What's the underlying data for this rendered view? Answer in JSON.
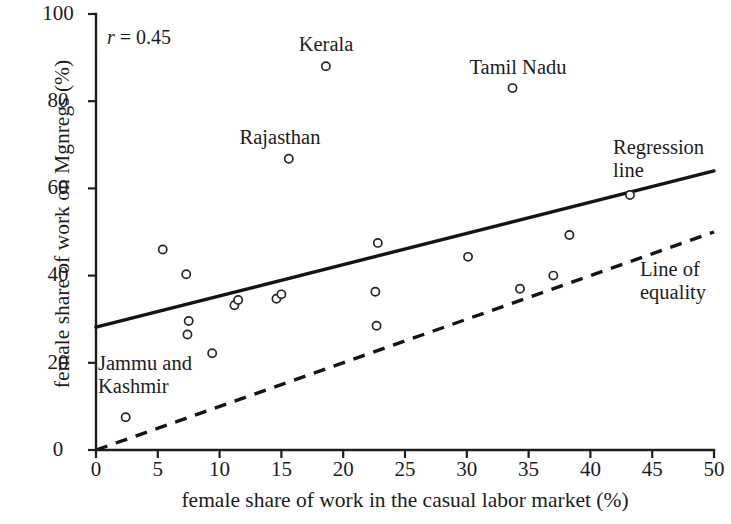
{
  "chart_data": {
    "type": "scatter",
    "title": "",
    "xlabel": "female share of work in the casual labor market (%)",
    "ylabel": "female share of work on Mgnregs (%)",
    "xlim": [
      0,
      50
    ],
    "ylim": [
      0,
      100
    ],
    "xticks": [
      "0",
      "5",
      "10",
      "15",
      "20",
      "25",
      "30",
      "35",
      "40",
      "45",
      "50"
    ],
    "yticks": [
      "0",
      "20",
      "40",
      "60",
      "80",
      "100"
    ],
    "grid": false,
    "annotation": "r = 0.45",
    "annotation_symbol": "r",
    "annotation_value": "= 0.45",
    "correlation": 0.45,
    "points": [
      {
        "x": 2.4,
        "y": 7.5,
        "label": "Jammu and Kashmir",
        "label_pos": "above"
      },
      {
        "x": 5.4,
        "y": 46.0,
        "label": ""
      },
      {
        "x": 7.3,
        "y": 40.3,
        "label": ""
      },
      {
        "x": 7.5,
        "y": 29.6,
        "label": ""
      },
      {
        "x": 7.4,
        "y": 26.5,
        "label": ""
      },
      {
        "x": 9.4,
        "y": 22.2,
        "label": ""
      },
      {
        "x": 11.2,
        "y": 33.2,
        "label": ""
      },
      {
        "x": 11.5,
        "y": 34.4,
        "label": ""
      },
      {
        "x": 14.6,
        "y": 34.7,
        "label": ""
      },
      {
        "x": 15.0,
        "y": 35.7,
        "label": ""
      },
      {
        "x": 15.6,
        "y": 66.8,
        "label": "Rajasthan",
        "label_pos": "above"
      },
      {
        "x": 18.6,
        "y": 88.0,
        "label": "Kerala",
        "label_pos": "above"
      },
      {
        "x": 22.8,
        "y": 47.5,
        "label": ""
      },
      {
        "x": 22.6,
        "y": 36.3,
        "label": ""
      },
      {
        "x": 22.7,
        "y": 28.5,
        "label": ""
      },
      {
        "x": 30.1,
        "y": 44.3,
        "label": ""
      },
      {
        "x": 33.7,
        "y": 83.0,
        "label": "Tamil Nadu",
        "label_pos": "above"
      },
      {
        "x": 34.3,
        "y": 37.0,
        "label": ""
      },
      {
        "x": 37.0,
        "y": 40.0,
        "label": ""
      },
      {
        "x": 38.3,
        "y": 49.3,
        "label": ""
      },
      {
        "x": 43.2,
        "y": 58.5,
        "label": ""
      }
    ],
    "series": [
      {
        "name": "Regression line",
        "type": "line",
        "style": "solid",
        "x": [
          0,
          50
        ],
        "y": [
          28.2,
          64.0
        ]
      },
      {
        "name": "Line of equality",
        "type": "line",
        "style": "dashed",
        "x": [
          0,
          50
        ],
        "y": [
          0,
          50
        ]
      }
    ],
    "legend_position": "inline-right",
    "legend": [
      {
        "label": "Regression line",
        "style": "solid"
      },
      {
        "label": "Line of equality",
        "style": "dashed"
      }
    ]
  },
  "labels": {
    "kerala": "Kerala",
    "tamil_nadu": "Tamil Nadu",
    "rajasthan": "Rajasthan",
    "jammu_kashmir_line1": "Jammu and",
    "jammu_kashmir_line2": "Kashmir",
    "regression_line1": "Regression",
    "regression_line2": "line",
    "equality_line1": "Line of",
    "equality_line2": "equality"
  },
  "axes": {
    "y_title": "female share of work on Mgnregs (%)",
    "x_title": "female share of work in the casual labor market (%)",
    "y_ticks": [
      "100",
      "80",
      "60",
      "40",
      "20",
      "0"
    ],
    "x_ticks": [
      "0",
      "5",
      "10",
      "15",
      "20",
      "25",
      "30",
      "35",
      "40",
      "45",
      "50"
    ]
  },
  "annotation": {
    "symbol": "r",
    "rest": " = 0.45"
  },
  "colors": {
    "ink": "#1c1c1c",
    "background": "#ffffff",
    "marker_stroke": "#262626"
  }
}
